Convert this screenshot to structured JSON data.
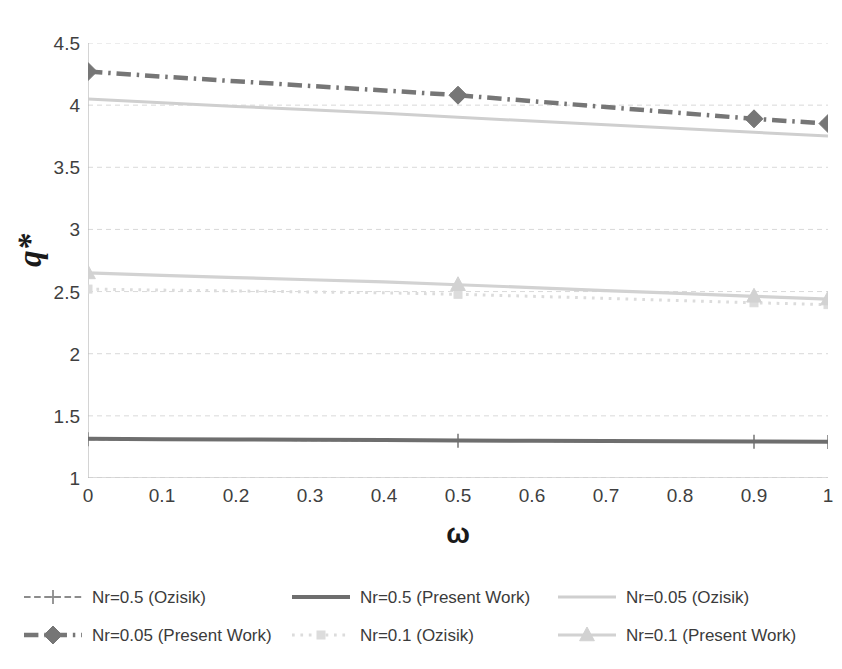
{
  "chart_data": {
    "type": "line",
    "title": "",
    "xlabel": "ω",
    "ylabel": "q*",
    "xlim": [
      0,
      1
    ],
    "ylim": [
      1,
      4.5
    ],
    "grid": true,
    "grid_axis": "y",
    "legend_position": "bottom",
    "x_ticks": [
      "0",
      "0.1",
      "0.2",
      "0.3",
      "0.4",
      "0.5",
      "0.6",
      "0.7",
      "0.8",
      "0.9",
      "1"
    ],
    "y_ticks": [
      "1",
      "1.5",
      "2",
      "2.5",
      "3",
      "3.5",
      "4",
      "4.5"
    ],
    "x": [
      0,
      0.1,
      0.2,
      0.3,
      0.4,
      0.5,
      0.6,
      0.7,
      0.8,
      0.9,
      1
    ],
    "series": [
      {
        "name": "Nr=0.5 (Ozisik)",
        "values": [
          1.312,
          1.309,
          1.307,
          1.305,
          1.302,
          1.3,
          1.298,
          1.296,
          1.294,
          1.292,
          1.29
        ],
        "color": "#8c8c8c",
        "style": "dash",
        "marker": "plus",
        "marker_at": [
          0,
          0.5,
          0.9,
          1
        ],
        "width": 2.2
      },
      {
        "name": "Nr=0.5 (Present Work)",
        "values": [
          1.315,
          1.312,
          1.31,
          1.307,
          1.305,
          1.302,
          1.3,
          1.297,
          1.295,
          1.293,
          1.291
        ],
        "color": "#6e6e6e",
        "style": "solid",
        "marker": "none",
        "marker_at": [],
        "width": 4.0
      },
      {
        "name": "Nr=0.05 (Ozisik)",
        "values": [
          4.05,
          4.02,
          3.99,
          3.962,
          3.934,
          3.902,
          3.872,
          3.842,
          3.812,
          3.782,
          3.752
        ],
        "color": "#cfcfcf",
        "style": "solid",
        "marker": "none",
        "marker_at": [],
        "width": 3.0
      },
      {
        "name": "Nr=0.05 (Present Work)",
        "values": [
          4.27,
          4.23,
          4.192,
          4.155,
          4.118,
          4.08,
          4.032,
          3.985,
          3.937,
          3.89,
          3.852
        ],
        "color": "#767676",
        "style": "dashdot",
        "marker": "diamond",
        "marker_at": [
          0,
          0.5,
          0.9,
          1
        ],
        "width": 4.5
      },
      {
        "name": "Nr=0.1 (Ozisik)",
        "values": [
          2.52,
          2.512,
          2.505,
          2.497,
          2.49,
          2.478,
          2.462,
          2.445,
          2.428,
          2.41,
          2.395
        ],
        "color": "#dcdcdc",
        "style": "dot",
        "marker": "square",
        "marker_at": [
          0,
          0.5,
          0.9,
          1
        ],
        "width": 3.0
      },
      {
        "name": "Nr=0.1 (Present Work)",
        "values": [
          2.65,
          2.63,
          2.612,
          2.595,
          2.578,
          2.555,
          2.532,
          2.508,
          2.485,
          2.462,
          2.44
        ],
        "color": "#d2d2d2",
        "style": "solid",
        "marker": "triangle",
        "marker_at": [
          0,
          0.5,
          0.9,
          1
        ],
        "width": 3.2
      }
    ],
    "legend": [
      "Nr=0.5 (Ozisik)",
      "Nr=0.5 (Present Work)",
      "Nr=0.05 (Ozisik)",
      "Nr=0.05 (Present Work)",
      "Nr=0.1 (Ozisik)",
      "Nr=0.1 (Present Work)"
    ]
  },
  "colors": {
    "axis": "#b8b8b8",
    "grid": "#d9d9d9",
    "tick_text": "#3f3f3f",
    "title_text": "#1a1a1a",
    "background": "#ffffff"
  }
}
